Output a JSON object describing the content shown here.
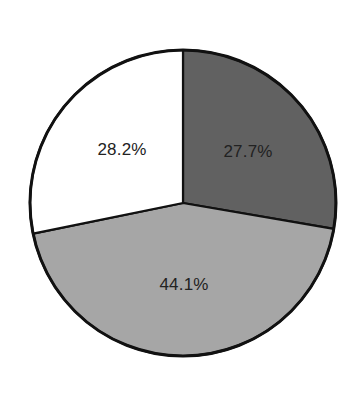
{
  "chart_data": {
    "type": "pie",
    "title": "",
    "categories": [
      "Slice A",
      "Slice B",
      "Slice C"
    ],
    "values": [
      27.7,
      44.1,
      28.2
    ],
    "labels": [
      "27.7%",
      "44.1%",
      "28.2%"
    ],
    "colors": [
      "#616161",
      "#a6a6a6",
      "#ffffff"
    ],
    "start_angle_deg": 0,
    "direction": "clockwise",
    "legend": null,
    "center": [
      183,
      203
    ],
    "radius": 153
  },
  "labels": {
    "slice_dark": "27.7%",
    "slice_gray": "44.1%",
    "slice_white": "28.2%"
  }
}
